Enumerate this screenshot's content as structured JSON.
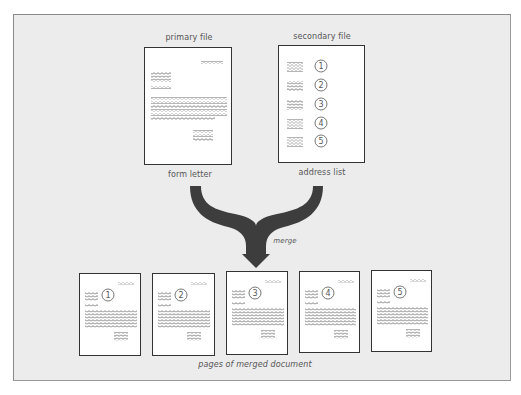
{
  "diagram": {
    "title_primary": "primary file",
    "title_secondary": "secondary file",
    "caption_primary": "form letter",
    "caption_secondary": "address list",
    "arrow_label": "merge",
    "caption_merged": "pages of merged document",
    "address_numbers": [
      "1",
      "2",
      "3",
      "4",
      "5"
    ],
    "merged_pages": [
      {
        "number": "1"
      },
      {
        "number": "2"
      },
      {
        "number": "3"
      },
      {
        "number": "4"
      },
      {
        "number": "5"
      }
    ],
    "colors": {
      "panel_background": "#ececec",
      "page_background": "#ffffff",
      "page_border": "#333333",
      "arrow": "#3d3d3d",
      "text": "#555555"
    }
  }
}
